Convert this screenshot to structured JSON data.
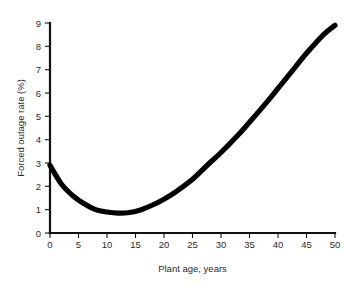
{
  "chart_data": {
    "type": "line",
    "title": "",
    "xlabel": "Plant age, years",
    "ylabel": "Forced outage rate (%)",
    "xlim": [
      0,
      50
    ],
    "ylim": [
      0,
      9
    ],
    "grid": false,
    "legend": null,
    "xticks": [
      "0",
      "5",
      "10",
      "15",
      "20",
      "25",
      "30",
      "35",
      "40",
      "45",
      "50"
    ],
    "ytick_values": [
      0,
      1,
      2,
      3,
      4,
      5,
      6,
      7,
      8,
      9
    ],
    "yticks": [
      "0",
      "1",
      "2",
      "3",
      "4",
      "5",
      "6",
      "7",
      "8",
      "9"
    ],
    "xtick_values": [
      0,
      5,
      10,
      15,
      20,
      25,
      30,
      35,
      40,
      45,
      50
    ],
    "series": [
      {
        "name": "Forced outage rate",
        "color": "#000000",
        "x": [
          0,
          2,
          4,
          6,
          8,
          10,
          12,
          14,
          16,
          18,
          20,
          22,
          25,
          28,
          30,
          33,
          35,
          38,
          40,
          43,
          45,
          48,
          50
        ],
        "values": [
          2.9,
          2.1,
          1.6,
          1.25,
          1.0,
          0.9,
          0.85,
          0.88,
          1.0,
          1.2,
          1.45,
          1.75,
          2.3,
          3.0,
          3.45,
          4.2,
          4.75,
          5.6,
          6.2,
          7.1,
          7.7,
          8.5,
          8.9
        ]
      }
    ]
  },
  "figure": {
    "background_color": "#ffffff",
    "curve_color": "#000000",
    "axis_color": "#111111"
  }
}
